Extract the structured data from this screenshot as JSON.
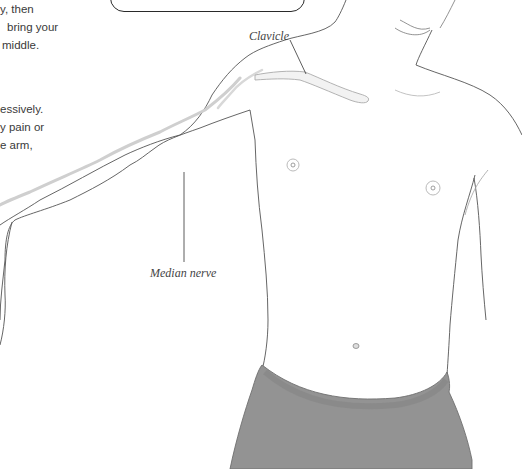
{
  "document": {
    "type": "anatomy-illustration-page",
    "instructions_paragraph_1": {
      "lines": [
        "y, then",
        "bring your",
        "middle."
      ]
    },
    "instructions_paragraph_2": {
      "lines": [
        "essively.",
        "y pain or",
        "e arm,"
      ]
    },
    "callout_box": {
      "visible": true,
      "text": ""
    },
    "figure": {
      "description": "Male torso with left arm outstretched showing clavicle and median nerve",
      "labels": {
        "clavicle": "Clavicle",
        "median_nerve": "Median nerve"
      },
      "colors": {
        "outline": "#5a5a5a",
        "nerve": "#cfcfcf",
        "shorts": "#8f8f8f",
        "text": "#3a3a3a",
        "label_text": "#444444"
      }
    }
  }
}
